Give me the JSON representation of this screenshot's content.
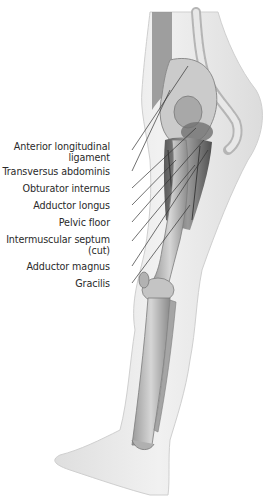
{
  "diagram": {
    "colors": {
      "skin": "#ececec",
      "skin_edge": "#cfcfcf",
      "bone": "#c9c9c9",
      "bone_dark": "#8e8e8e",
      "muscle": "#7d7d7d",
      "muscle_dark": "#4a4a4a",
      "leader": "#333333",
      "text": "#2a2a2a"
    },
    "labels": [
      {
        "id": "anterior-longitudinal-ligament",
        "line1": "Anterior longitudinal",
        "line2": "ligament",
        "top": 141
      },
      {
        "id": "transversus-abdominis",
        "line1": "Transversus abdominis",
        "top": 168
      },
      {
        "id": "obturator-internus",
        "line1": "Obturator internus",
        "top": 185
      },
      {
        "id": "adductor-longus",
        "line1": "Adductor longus",
        "top": 202
      },
      {
        "id": "pelvic-floor",
        "line1": "Pelvic floor",
        "top": 219
      },
      {
        "id": "intermuscular-septum",
        "line1": "Intermuscular septum",
        "line2": "(cut)",
        "top": 236
      },
      {
        "id": "adductor-magnus",
        "line1": "Adductor magnus",
        "top": 263
      },
      {
        "id": "gracilis",
        "line1": "Gracilis",
        "top": 280
      }
    ]
  }
}
